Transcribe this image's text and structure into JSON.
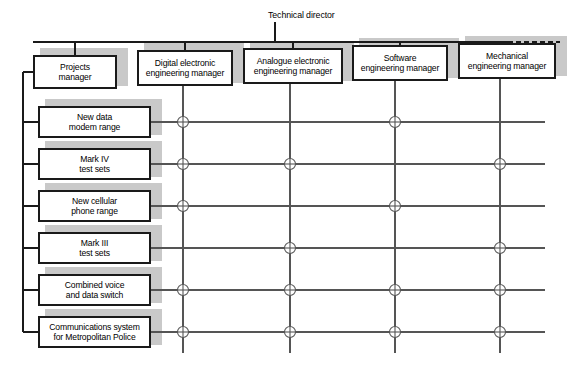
{
  "diagram": {
    "title_label": "Technical director",
    "colors": {
      "box_border": "#1a1a1a",
      "box_fill": "#ffffff",
      "shadow": "#c9c9c9",
      "line": "#555555",
      "bus_line": "#1a1a1a",
      "text": "#000000"
    },
    "managers": [
      {
        "id": "projects-manager",
        "lines": [
          "Projects",
          "manager"
        ],
        "x": 33,
        "y": 55,
        "w": 84,
        "h": 34
      },
      {
        "id": "digital-electronic-engineering-manager",
        "lines": [
          "Digital electronic",
          "engineering manager"
        ],
        "x": 137,
        "y": 50,
        "w": 96,
        "h": 36
      },
      {
        "id": "analogue-electronic-engineering-manager",
        "lines": [
          "Analogue electronic",
          "engineering manager"
        ],
        "x": 243,
        "y": 48,
        "w": 100,
        "h": 36
      },
      {
        "id": "software-engineering-manager",
        "lines": [
          "Software",
          "engineering manager"
        ],
        "x": 352,
        "y": 45,
        "w": 96,
        "h": 36
      },
      {
        "id": "mechanical-engineering-manager",
        "lines": [
          "Mechanical",
          "engineering manager"
        ],
        "x": 458,
        "y": 43,
        "w": 98,
        "h": 36
      }
    ],
    "projects": [
      {
        "id": "new-data-modem-range",
        "lines": [
          "New data",
          "modem range"
        ],
        "x": 38,
        "y": 106,
        "w": 113,
        "h": 32
      },
      {
        "id": "mark-iv-test-sets",
        "lines": [
          "Mark IV",
          "test sets"
        ],
        "x": 38,
        "y": 148,
        "w": 113,
        "h": 32
      },
      {
        "id": "new-cellular-phone-range",
        "lines": [
          "New cellular",
          "phone range"
        ],
        "x": 38,
        "y": 190,
        "w": 113,
        "h": 32
      },
      {
        "id": "mark-iii-test-sets",
        "lines": [
          "Mark III",
          "test sets"
        ],
        "x": 38,
        "y": 232,
        "w": 113,
        "h": 32
      },
      {
        "id": "combined-voice-and-data-switch",
        "lines": [
          "Combined voice",
          "and data switch"
        ],
        "x": 38,
        "y": 274,
        "w": 113,
        "h": 32
      },
      {
        "id": "communications-system-for-metropolitan-police",
        "lines": [
          "Communications system",
          "for Metropolitan Police"
        ],
        "x": 38,
        "y": 316,
        "w": 113,
        "h": 32
      }
    ],
    "matrix": {
      "column_ids": [
        "digital-electronic-engineering-manager",
        "analogue-electronic-engineering-manager",
        "software-engineering-manager",
        "mechanical-engineering-manager"
      ],
      "row_ids": [
        "new-data-modem-range",
        "mark-iv-test-sets",
        "new-cellular-phone-range",
        "mark-iii-test-sets",
        "combined-voice-and-data-switch",
        "communications-system-for-metropolitan-police"
      ],
      "column_x": [
        183,
        290,
        395,
        500
      ],
      "row_y": [
        122,
        164,
        206,
        248,
        290,
        332
      ],
      "links": [
        [
          1,
          0,
          1,
          0
        ],
        [
          1,
          1,
          0,
          1
        ],
        [
          1,
          0,
          1,
          0
        ],
        [
          0,
          1,
          0,
          1
        ],
        [
          1,
          1,
          1,
          1
        ],
        [
          1,
          1,
          1,
          1
        ]
      ]
    },
    "bus": {
      "y": 42,
      "x_start": 33,
      "x_solid_end": 508,
      "x_dash_end": 560,
      "director_stem_x": 275,
      "director_label_x": 268,
      "director_label_y": 10
    },
    "spine": {
      "x": 23,
      "y_top": 72,
      "y_bottom": 332
    },
    "row_line_x_end": 545,
    "column_line_y_end": 353
  }
}
